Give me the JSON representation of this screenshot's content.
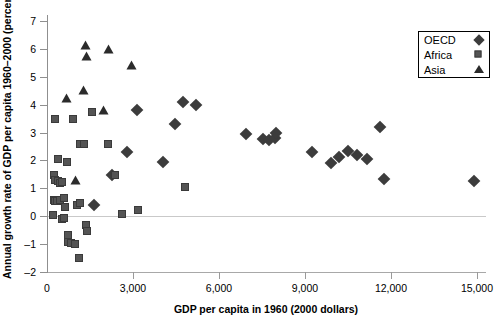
{
  "chart_data": {
    "type": "scatter",
    "title": "",
    "xlabel": "GDP per capita in 1960 (2000 dollars)",
    "ylabel": "Annual growth rate of GDP per capita 1960–2000 (percent)",
    "xlim": [
      0,
      15200
    ],
    "ylim": [
      -2,
      7
    ],
    "xticks": [
      0,
      3000,
      6000,
      9000,
      12000,
      15000
    ],
    "xticklabels": [
      "0",
      "3,000",
      "6,000",
      "9,000",
      "12,000",
      "15,000"
    ],
    "yticks": [
      -2,
      -1,
      0,
      1,
      2,
      3,
      4,
      5,
      6,
      7
    ],
    "yticklabels": [
      "–2",
      "–1",
      "0",
      "1",
      "2",
      "3",
      "4",
      "5",
      "6",
      "7"
    ],
    "grid": false,
    "reference_line_y": 0,
    "legend_position": "top-right",
    "series": [
      {
        "name": "OECD",
        "marker": "diamond",
        "color": "#3c3c3c",
        "points": [
          [
            2800,
            2.3
          ],
          [
            3150,
            3.8
          ],
          [
            4050,
            1.95
          ],
          [
            4450,
            3.3
          ],
          [
            4750,
            4.1
          ],
          [
            5200,
            4.0
          ],
          [
            6950,
            2.95
          ],
          [
            7550,
            2.78
          ],
          [
            7750,
            2.72
          ],
          [
            7950,
            2.8
          ],
          [
            8000,
            3.0
          ],
          [
            9250,
            2.32
          ],
          [
            9900,
            1.9
          ],
          [
            10200,
            2.12
          ],
          [
            10500,
            2.35
          ],
          [
            10800,
            2.18
          ],
          [
            11150,
            2.05
          ],
          [
            11600,
            3.2
          ],
          [
            11750,
            1.32
          ],
          [
            14900,
            1.25
          ],
          [
            1650,
            0.42
          ],
          [
            2250,
            1.48
          ]
        ]
      },
      {
        "name": "Africa",
        "marker": "square",
        "color": "#545454",
        "points": [
          [
            300,
            3.45
          ],
          [
            950,
            3.45
          ],
          [
            430,
            2.0
          ],
          [
            730,
            1.9
          ],
          [
            1200,
            2.55
          ],
          [
            1320,
            2.55
          ],
          [
            2150,
            2.55
          ],
          [
            2400,
            1.45
          ],
          [
            290,
            1.45
          ],
          [
            330,
            1.25
          ],
          [
            420,
            1.22
          ],
          [
            480,
            1.15
          ],
          [
            560,
            1.18
          ],
          [
            270,
            0.55
          ],
          [
            330,
            0.5
          ],
          [
            400,
            0.52
          ],
          [
            500,
            0.55
          ],
          [
            620,
            0.6
          ],
          [
            680,
            0.3
          ],
          [
            1080,
            0.38
          ],
          [
            1180,
            0.45
          ],
          [
            230,
            0.02
          ],
          [
            560,
            -0.12
          ],
          [
            620,
            -0.1
          ],
          [
            1380,
            -0.35
          ],
          [
            1420,
            -0.55
          ],
          [
            780,
            -0.72
          ],
          [
            760,
            -0.95
          ],
          [
            880,
            -0.98
          ],
          [
            1000,
            -1.02
          ],
          [
            1150,
            -1.52
          ],
          [
            2650,
            0.03
          ],
          [
            3200,
            0.2
          ],
          [
            4850,
            1.02
          ],
          [
            1600,
            3.7
          ]
        ]
      },
      {
        "name": "Asia",
        "marker": "triangle",
        "color": "#2b2b2b",
        "points": [
          [
            1350,
            6.1
          ],
          [
            1400,
            5.72
          ],
          [
            2150,
            5.95
          ],
          [
            2950,
            5.38
          ],
          [
            1300,
            4.5
          ],
          [
            700,
            4.22
          ],
          [
            2000,
            3.78
          ],
          [
            1000,
            1.25
          ]
        ]
      }
    ]
  },
  "legend": {
    "entries": [
      {
        "label": "OECD",
        "marker": "diamond"
      },
      {
        "label": "Africa",
        "marker": "square"
      },
      {
        "label": "Asia",
        "marker": "triangle"
      }
    ]
  }
}
